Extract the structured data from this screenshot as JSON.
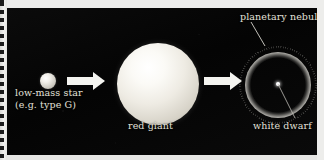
{
  "figure": {
    "panel_background": "#060606",
    "label_color": "#e3e1da",
    "arrow_color": "#f4f4f0"
  },
  "stages": [
    {
      "id": "low-mass-star",
      "label_line_1": "low-mass star",
      "label_line_2": "(e.g. type G)",
      "shape": "small-sphere",
      "color": "#f2f0ea"
    },
    {
      "id": "red-giant",
      "label_line_1": "red giant",
      "label_line_2": "",
      "shape": "large-sphere",
      "color": "#eeebe3"
    },
    {
      "id": "planetary-nebula",
      "label_line_1": "planetary nebula",
      "label_line_2": "",
      "shape": "spiky-ring",
      "color": "#eceae3"
    },
    {
      "id": "white-dwarf",
      "label_line_1": "white dwarf",
      "label_line_2": "",
      "shape": "point",
      "color": "#ffffff"
    }
  ],
  "arrows": [
    {
      "id": "arrow-1",
      "from": "low-mass-star",
      "to": "red-giant",
      "direction": "right"
    },
    {
      "id": "arrow-2",
      "from": "red-giant",
      "to": "planetary-nebula",
      "direction": "right"
    }
  ],
  "leader_lines": [
    {
      "id": "leader-nebula",
      "from_label": "planetary nebula",
      "to_target": "nebula-ring"
    },
    {
      "id": "leader-dwarf",
      "from_label": "white dwarf",
      "to_target": "white-dwarf-dot"
    }
  ],
  "scan_artifacts": {
    "margin_side": "left",
    "binding_marks": 20,
    "margin_color": "#ececeb"
  }
}
